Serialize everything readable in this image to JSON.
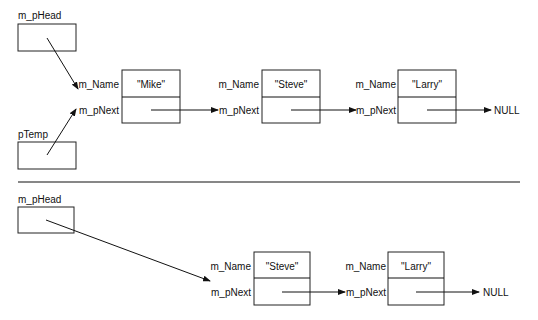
{
  "top": {
    "head_label": "m_pHead",
    "temp_label": "pTemp",
    "nodes": [
      {
        "name_label": "m_Name",
        "next_label": "m_pNext",
        "value": "\"Mike\""
      },
      {
        "name_label": "m_Name",
        "next_label": "m_pNext",
        "value": "\"Steve\""
      },
      {
        "name_label": "m_Name",
        "next_label": "m_pNext",
        "value": "\"Larry\""
      }
    ],
    "null_label": "NULL"
  },
  "bottom": {
    "head_label": "m_pHead",
    "nodes": [
      {
        "name_label": "m_Name",
        "next_label": "m_pNext",
        "value": "\"Steve\""
      },
      {
        "name_label": "m_Name",
        "next_label": "m_pNext",
        "value": "\"Larry\""
      }
    ],
    "null_label": "NULL"
  }
}
